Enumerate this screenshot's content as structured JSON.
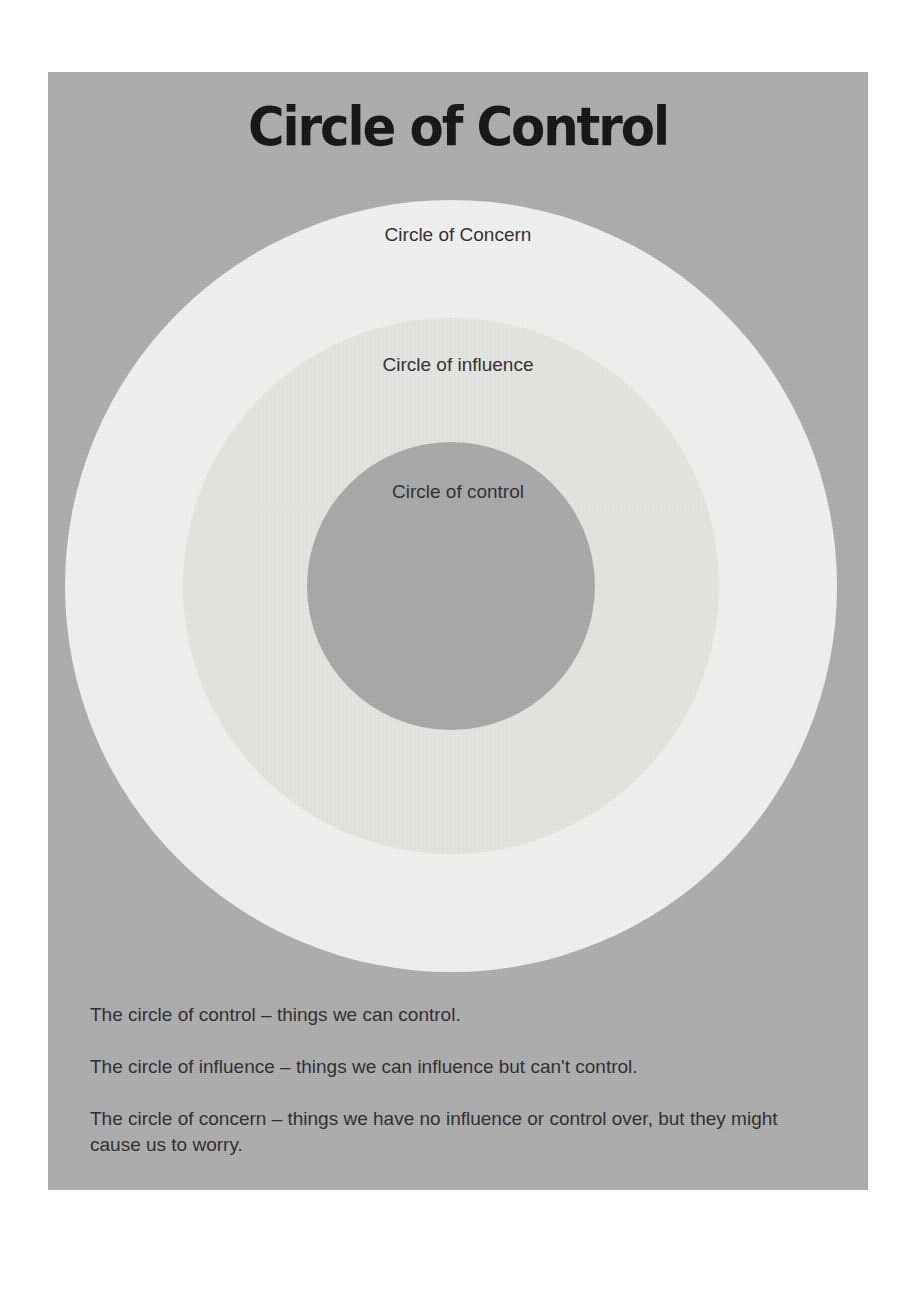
{
  "poster": {
    "title": "Circle of Control",
    "background_color": "#aeaeae",
    "page_background_color": "#ffffff"
  },
  "diagram": {
    "type": "concentric-circles",
    "rings": [
      {
        "id": "concern",
        "label": "Circle of Concern",
        "color": "#f4f4f2",
        "order": 1,
        "position": "outer"
      },
      {
        "id": "influence",
        "label": "Circle of influence",
        "color": "#e7e7e4",
        "order": 2,
        "position": "middle"
      },
      {
        "id": "control",
        "label": "Circle of control",
        "color": "#a9a9a9",
        "order": 3,
        "position": "inner"
      }
    ]
  },
  "notes": [
    "The circle of control – things we can control.",
    "The circle of influence – things we can influence but can't control.",
    "The circle of concern – things we have no influence or control over, but they might cause us to worry."
  ]
}
